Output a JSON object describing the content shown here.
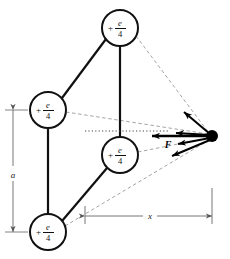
{
  "figure": {
    "type": "physics-force-diagram",
    "background_color": "#ffffff",
    "line_color": "#111111",
    "dashed_color": "#999999",
    "dim_color": "#666666"
  },
  "charges": [
    {
      "id": "top",
      "sign": "+",
      "numerator": "e",
      "denominator": "4",
      "cx": 120,
      "cy": 28,
      "r": 18
    },
    {
      "id": "left",
      "sign": "+",
      "numerator": "e",
      "denominator": "4",
      "cx": 48,
      "cy": 110,
      "r": 18
    },
    {
      "id": "middle",
      "sign": "+",
      "numerator": "e",
      "denominator": "4",
      "cx": 120,
      "cy": 155,
      "r": 18
    },
    {
      "id": "bottom",
      "sign": "+",
      "numerator": "e",
      "denominator": "4",
      "cx": 48,
      "cy": 232,
      "r": 18
    }
  ],
  "test_point": {
    "label": "",
    "cx": 212,
    "cy": 136,
    "r": 6
  },
  "dimensions": [
    {
      "id": "a",
      "label": "a",
      "orientation": "vertical",
      "x": 13,
      "y_start": 110,
      "y_end": 232,
      "label_x": 13,
      "label_y": 174
    },
    {
      "id": "x",
      "label": "x",
      "orientation": "horizontal",
      "y": 216,
      "x_start": 85,
      "x_end": 212,
      "label_x": 150,
      "label_y": 212
    }
  ],
  "force_vector": {
    "label": "F",
    "label_x": 168,
    "label_y": 148,
    "tip_x": 152,
    "tip_y": 136,
    "tail_x": 212,
    "tail_y": 136
  },
  "component_vectors": [
    {
      "id": "from-top",
      "tip_x": 184,
      "tip_y": 112
    },
    {
      "id": "from-left",
      "tip_x": 176,
      "tip_y": 133
    },
    {
      "id": "from-middle",
      "tip_x": 178,
      "tip_y": 144
    },
    {
      "id": "from-bottom",
      "tip_x": 172,
      "tip_y": 156
    }
  ],
  "axis_line": {
    "id": "reference-axis",
    "style": "dotted",
    "x_start": 85,
    "x_end": 168,
    "y": 131
  }
}
